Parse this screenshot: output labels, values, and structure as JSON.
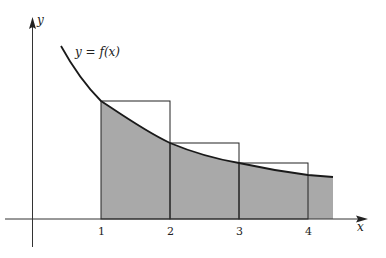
{
  "figure": {
    "curve_label": "y = f(x)",
    "axis_x_label": "x",
    "axis_y_label": "y",
    "x_ticks": [
      "1",
      "2",
      "3",
      "4"
    ],
    "colors": {
      "shade": "#a9a9a9",
      "stroke": "#222222",
      "background": "#ffffff"
    },
    "regions": {
      "shaded_area": "area under curve from x = 1 to beyond x = 4",
      "rectangles": [
        {
          "from": "1",
          "to": "2",
          "height": "f(1)"
        },
        {
          "from": "2",
          "to": "3",
          "height": "f(2)"
        },
        {
          "from": "3",
          "to": "4",
          "height": "f(3)"
        }
      ]
    }
  }
}
